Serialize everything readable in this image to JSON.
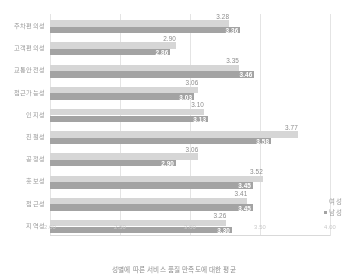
{
  "chart_data": {
    "type": "bar",
    "orientation": "horizontal",
    "title": "",
    "xlabel": "",
    "ylabel": "",
    "xlim": [
      2.0,
      4.0
    ],
    "xticks": [
      "2.00",
      "2.50",
      "3.00",
      "3.50",
      "4.00"
    ],
    "xtick_values": [
      2.0,
      2.5,
      3.0,
      3.5,
      4.0
    ],
    "grid": true,
    "legend_position": "right",
    "categories": [
      "주차편의성",
      "고객편의성",
      "교통안전성",
      "접근가능성",
      "인지성",
      "친절성",
      "공정성",
      "홍보성",
      "접근성",
      "지역성"
    ],
    "series": [
      {
        "name": "여성",
        "color": "#d6d6d6",
        "values": [
          3.28,
          2.9,
          3.35,
          3.06,
          3.1,
          3.77,
          3.06,
          3.52,
          3.41,
          3.26
        ]
      },
      {
        "name": "남성",
        "color": "#a3a3a3",
        "values": [
          3.36,
          2.86,
          3.46,
          3.03,
          3.13,
          3.58,
          2.9,
          3.45,
          3.45,
          3.3
        ]
      }
    ],
    "value_labels": {
      "여성": [
        "3.28",
        "2.90",
        "3.35",
        "3.06",
        "3.10",
        "3.77",
        "3.06",
        "3.52",
        "3.41",
        "3.26"
      ],
      "남성": [
        "3.36",
        "2.86",
        "3.46",
        "3.03",
        "3.13",
        "3.58",
        "2.90",
        "3.45",
        "3.45",
        "3.30"
      ]
    }
  },
  "legend": {
    "items": [
      {
        "label": "여성"
      },
      {
        "label": "남성"
      }
    ]
  },
  "caption": {
    "text": "성별에 따른 서비스 품질 만족도에 대한 평균"
  }
}
